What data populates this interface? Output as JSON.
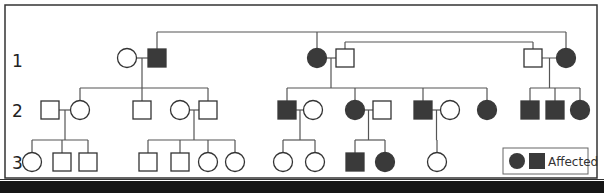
{
  "figure": {
    "type": "pedigree",
    "colors": {
      "affected": "#3a3a3a",
      "unaffected": "#ffffff",
      "line": "#555555",
      "border": "#333333",
      "caption_band": "#161616"
    },
    "generations": [
      {
        "label": "1"
      },
      {
        "label": "2"
      },
      {
        "label": "3"
      }
    ],
    "legend": {
      "label": "Affected",
      "symbols": [
        "circle-affected",
        "square-affected"
      ]
    },
    "caption": ""
  },
  "individuals": [
    {
      "id": "I-1",
      "gen": 1,
      "sex": "female",
      "affected": false
    },
    {
      "id": "I-2",
      "gen": 1,
      "sex": "male",
      "affected": true
    },
    {
      "id": "I-3",
      "gen": 1,
      "sex": "female",
      "affected": true
    },
    {
      "id": "I-4",
      "gen": 1,
      "sex": "male",
      "affected": false
    },
    {
      "id": "I-5",
      "gen": 1,
      "sex": "male",
      "affected": false
    },
    {
      "id": "I-6",
      "gen": 1,
      "sex": "female",
      "affected": true
    },
    {
      "id": "II-1",
      "gen": 2,
      "sex": "male",
      "affected": false
    },
    {
      "id": "II-2",
      "gen": 2,
      "sex": "female",
      "affected": false
    },
    {
      "id": "II-3",
      "gen": 2,
      "sex": "male",
      "affected": false
    },
    {
      "id": "II-4",
      "gen": 2,
      "sex": "female",
      "affected": false
    },
    {
      "id": "II-5",
      "gen": 2,
      "sex": "male",
      "affected": false
    },
    {
      "id": "II-6",
      "gen": 2,
      "sex": "male",
      "affected": true
    },
    {
      "id": "II-7",
      "gen": 2,
      "sex": "female",
      "affected": false
    },
    {
      "id": "II-8",
      "gen": 2,
      "sex": "female",
      "affected": true
    },
    {
      "id": "II-9",
      "gen": 2,
      "sex": "male",
      "affected": false
    },
    {
      "id": "II-10",
      "gen": 2,
      "sex": "male",
      "affected": true
    },
    {
      "id": "II-11",
      "gen": 2,
      "sex": "female",
      "affected": false
    },
    {
      "id": "II-12",
      "gen": 2,
      "sex": "female",
      "affected": true
    },
    {
      "id": "II-13",
      "gen": 2,
      "sex": "male",
      "affected": true
    },
    {
      "id": "II-14",
      "gen": 2,
      "sex": "male",
      "affected": true
    },
    {
      "id": "II-15",
      "gen": 2,
      "sex": "female",
      "affected": true
    },
    {
      "id": "III-1",
      "gen": 3,
      "sex": "female",
      "affected": false
    },
    {
      "id": "III-2",
      "gen": 3,
      "sex": "male",
      "affected": false
    },
    {
      "id": "III-3",
      "gen": 3,
      "sex": "male",
      "affected": false
    },
    {
      "id": "III-4",
      "gen": 3,
      "sex": "male",
      "affected": false
    },
    {
      "id": "III-5",
      "gen": 3,
      "sex": "male",
      "affected": false
    },
    {
      "id": "III-6",
      "gen": 3,
      "sex": "female",
      "affected": false
    },
    {
      "id": "III-7",
      "gen": 3,
      "sex": "female",
      "affected": false
    },
    {
      "id": "III-8",
      "gen": 3,
      "sex": "female",
      "affected": false
    },
    {
      "id": "III-9",
      "gen": 3,
      "sex": "female",
      "affected": false
    },
    {
      "id": "III-10",
      "gen": 3,
      "sex": "male",
      "affected": true
    },
    {
      "id": "III-11",
      "gen": 3,
      "sex": "female",
      "affected": true
    },
    {
      "id": "III-12",
      "gen": 3,
      "sex": "female",
      "affected": false
    }
  ],
  "couples": [
    [
      "I-1",
      "I-2"
    ],
    [
      "I-3",
      "I-4"
    ],
    [
      "I-5",
      "I-6"
    ],
    [
      "II-1",
      "II-2"
    ],
    [
      "II-4",
      "II-5"
    ],
    [
      "II-6",
      "II-7"
    ],
    [
      "II-8",
      "II-9"
    ],
    [
      "II-10",
      "II-11"
    ]
  ],
  "families": [
    {
      "parents": [
        "I-1",
        "I-2"
      ],
      "children": [
        "II-2",
        "II-3",
        "II-5"
      ]
    },
    {
      "parents": [
        "I-3",
        "I-4"
      ],
      "children": [
        "II-6",
        "II-8",
        "II-10",
        "II-12"
      ]
    },
    {
      "parents": [
        "I-5",
        "I-6"
      ],
      "children": [
        "II-13",
        "II-14",
        "II-15"
      ]
    },
    {
      "parents": [
        "II-1",
        "II-2"
      ],
      "children": [
        "III-1",
        "III-2",
        "III-3"
      ]
    },
    {
      "parents": [
        "II-4",
        "II-5"
      ],
      "children": [
        "III-4",
        "III-5",
        "III-6",
        "III-7"
      ]
    },
    {
      "parents": [
        "II-6",
        "II-7"
      ],
      "children": [
        "III-8",
        "III-9"
      ]
    },
    {
      "parents": [
        "II-8",
        "II-9"
      ],
      "children": [
        "III-10",
        "III-11"
      ]
    },
    {
      "parents": [
        "II-10",
        "II-11"
      ],
      "children": [
        "III-12"
      ]
    }
  ],
  "cross_links": [
    {
      "from": "I-2",
      "to": "I-6",
      "via": "I-3"
    },
    {
      "from": "I-4",
      "to": "I-5"
    }
  ]
}
